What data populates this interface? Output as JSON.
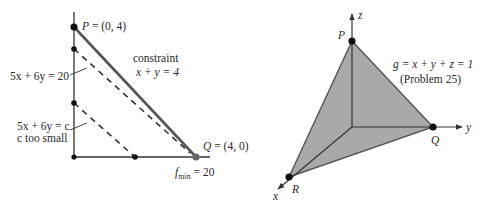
{
  "left_figure": {
    "title": "2D linear program",
    "point_P": {
      "name": "P",
      "label": " = (0, 4)"
    },
    "point_Q": {
      "name": "Q",
      "label": " = (4, 0)"
    },
    "constraint_label": "constraint",
    "constraint_eq": "x + y = 4",
    "level_line_20": "5x + 6y = 20",
    "level_line_c_line1": "5x + 6y = c",
    "level_line_c_line2": "c too small",
    "fmin": {
      "f": "f",
      "sub": "min",
      "value": " = 20"
    }
  },
  "right_figure": {
    "title": "3D simplex plane",
    "axis_x": "x",
    "axis_y": "y",
    "axis_z": "z",
    "point_P": "P",
    "point_Q": "Q",
    "point_R": "R",
    "plane_eq": "g = x + y + z = 1",
    "problem_ref": "(Problem 25)"
  },
  "colors": {
    "line": "#333333",
    "constraint": "#555555",
    "fill": "#a9a9a9",
    "dot": "#111111",
    "q_dot": "#666666"
  }
}
